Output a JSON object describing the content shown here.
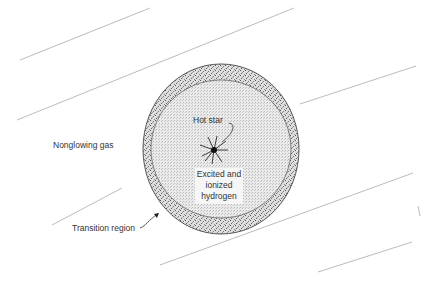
{
  "diagram": {
    "labels": {
      "hot_star": "Hot star",
      "excited_line1": "Excited and",
      "excited_line2": "ionized",
      "excited_line3": "hydrogen",
      "nonglowing_gas": "Nonglowing gas",
      "transition_region": "Transition region"
    },
    "colors": {
      "line": "#aaaaaa",
      "inner_fill": "#e6e6e6",
      "ring_fill": "#cfcfcf",
      "edge": "#555555",
      "star": "#111111"
    }
  }
}
